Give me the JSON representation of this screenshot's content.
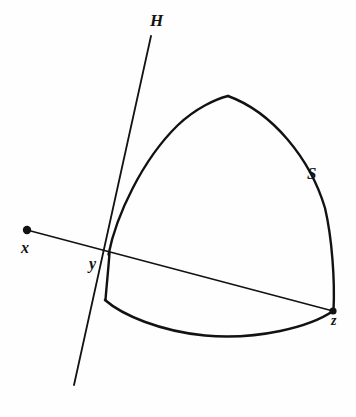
{
  "figure": {
    "kind": "geometry-diagram",
    "background_color": "#fefefe",
    "ink_color": "#121212",
    "labels": {
      "hyperplane": "H",
      "surface": "S",
      "point_x": "x",
      "point_y": "y",
      "point_z": "z"
    },
    "points": [
      {
        "name": "x",
        "label": "x",
        "cx": 27,
        "cy": 230,
        "r": 4.2,
        "filled": true
      },
      {
        "name": "z",
        "label": "z",
        "cx": 333,
        "cy": 311,
        "r": 3.6,
        "filled": true
      },
      {
        "name": "y",
        "label": "y",
        "cx": 108,
        "cy": 254,
        "r": 0,
        "filled": false
      }
    ],
    "lines": [
      {
        "name": "hyperplane-line-H",
        "label": "H",
        "from": {
          "x": 151,
          "y": 36
        },
        "to": {
          "x": 74,
          "y": 385
        },
        "stroke_width": 1.7
      },
      {
        "name": "segment-x-to-z",
        "label": "xz",
        "from": {
          "x": 27,
          "y": 230
        },
        "to": {
          "x": 333,
          "y": 311
        },
        "stroke_width": 1.6
      }
    ],
    "curves": [
      {
        "name": "surface-left-arc",
        "from": {
          "x": 108,
          "y": 254
        },
        "to": {
          "x": 228,
          "y": 96
        },
        "stroke_width": 2.4
      },
      {
        "name": "surface-right-arc",
        "from": {
          "x": 228,
          "y": 96
        },
        "to": {
          "x": 333,
          "y": 311
        },
        "stroke_width": 2.4
      },
      {
        "name": "surface-bottom-arc",
        "from": {
          "x": 105,
          "y": 300
        },
        "to": {
          "x": 333,
          "y": 311
        },
        "stroke_width": 2.6
      },
      {
        "name": "surface-left-edge-segment",
        "from": {
          "x": 109,
          "y": 253
        },
        "to": {
          "x": 105,
          "y": 300
        },
        "stroke_width": 2.4
      }
    ]
  }
}
